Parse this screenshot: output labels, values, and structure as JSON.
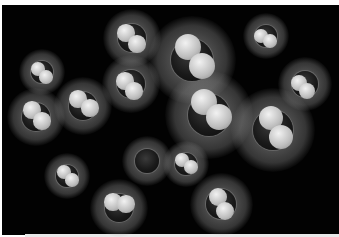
{
  "image": {
    "description": "Space-filling models of small molecules (dark central atom with white hydrogen atoms) glowing on a black background",
    "background": "#020202",
    "molecules": [
      {
        "x": 132,
        "y": 38,
        "r": 14,
        "h": [
          [
            -6,
            -5
          ],
          [
            5,
            6
          ]
        ]
      },
      {
        "x": 192,
        "y": 60,
        "r": 21,
        "h": [
          [
            -4,
            -13
          ],
          [
            10,
            6
          ]
        ]
      },
      {
        "x": 266,
        "y": 36,
        "r": 11,
        "h": [
          [
            -5,
            0
          ],
          [
            4,
            5
          ]
        ]
      },
      {
        "x": 42,
        "y": 72,
        "r": 11,
        "h": [
          [
            -4,
            -3
          ],
          [
            4,
            5
          ]
        ]
      },
      {
        "x": 131,
        "y": 84,
        "r": 14,
        "h": [
          [
            -6,
            -3
          ],
          [
            3,
            7
          ]
        ]
      },
      {
        "x": 305,
        "y": 84,
        "r": 13,
        "h": [
          [
            -6,
            -1
          ],
          [
            2,
            7
          ]
        ]
      },
      {
        "x": 36,
        "y": 117,
        "r": 14,
        "h": [
          [
            -4,
            -7
          ],
          [
            6,
            4
          ]
        ]
      },
      {
        "x": 83,
        "y": 106,
        "r": 14,
        "h": [
          [
            -5,
            -7
          ],
          [
            7,
            2
          ]
        ]
      },
      {
        "x": 209,
        "y": 115,
        "r": 21,
        "h": [
          [
            -5,
            -13
          ],
          [
            10,
            2
          ]
        ]
      },
      {
        "x": 273,
        "y": 130,
        "r": 20,
        "h": [
          [
            -2,
            -12
          ],
          [
            8,
            7
          ]
        ]
      },
      {
        "x": 67,
        "y": 176,
        "r": 11,
        "h": [
          [
            -3,
            -4
          ],
          [
            5,
            4
          ]
        ]
      },
      {
        "x": 147,
        "y": 161,
        "r": 12,
        "h": []
      },
      {
        "x": 186,
        "y": 164,
        "r": 11,
        "h": [
          [
            -4,
            -4
          ],
          [
            5,
            3
          ]
        ]
      },
      {
        "x": 119,
        "y": 208,
        "r": 14,
        "h": [
          [
            -6,
            -6
          ],
          [
            7,
            -4
          ]
        ]
      },
      {
        "x": 221,
        "y": 204,
        "r": 15,
        "h": [
          [
            -3,
            -7
          ],
          [
            4,
            7
          ]
        ]
      }
    ]
  }
}
